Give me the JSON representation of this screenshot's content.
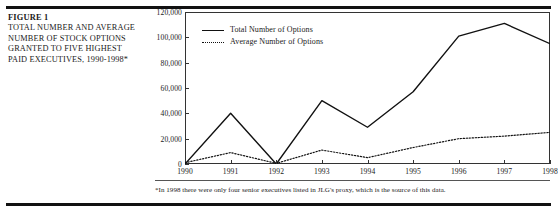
{
  "figure": {
    "label": "FIGURE 1",
    "title": "TOTAL NUMBER AND AVERAGE NUMBER OF STOCK OPTIONS GRANTED TO FIVE HIGHEST PAID EXECUTIVES, 1990-1998*",
    "footnote": "*In 1998 there were only four senior executives listed in JLG's proxy, which is the source of this data."
  },
  "chart_data": {
    "type": "line",
    "title": "",
    "xlabel": "",
    "ylabel": "",
    "categories": [
      "1990",
      "1991",
      "1992",
      "1993",
      "1994",
      "1995",
      "1996",
      "1997",
      "1998"
    ],
    "x": [
      1990,
      1991,
      1992,
      1993,
      1994,
      1995,
      1996,
      1997,
      1998
    ],
    "ylim": [
      0,
      120000
    ],
    "xlim": [
      1990,
      1998
    ],
    "ytick_labels": [
      "0",
      "20,000",
      "40,000",
      "60,000",
      "80,000",
      "100,000",
      "120,000"
    ],
    "ytick_values": [
      0,
      20000,
      40000,
      60000,
      80000,
      100000,
      120000
    ],
    "grid": false,
    "legend_position": "top-left-inside",
    "series": [
      {
        "name": "Total Number of Options",
        "style": "solid",
        "color": "#111111",
        "values": [
          0,
          40000,
          0,
          50000,
          29000,
          57000,
          101000,
          111000,
          95000
        ]
      },
      {
        "name": "Average Number of Options",
        "style": "dotted",
        "color": "#111111",
        "values": [
          1000,
          9000,
          500,
          11000,
          5000,
          13000,
          20000,
          22000,
          25000
        ]
      }
    ]
  }
}
